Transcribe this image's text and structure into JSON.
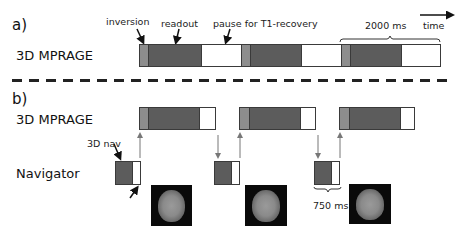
{
  "panel_a": {
    "section_label": "a)",
    "row_label": "3D MPRAGE",
    "annotations": {
      "inversion": "inversion",
      "readout": "readout",
      "pause": "pause for T1-recovery",
      "duration": "2000 ms",
      "time": "time"
    },
    "segments": [
      {
        "type": "inversion",
        "color": "#8d8d8d"
      },
      {
        "type": "readout",
        "color": "#5c5c5c"
      },
      {
        "type": "pause",
        "color": "#ffffff"
      }
    ],
    "repetitions": 3
  },
  "panel_b": {
    "section_label": "b)",
    "row_labels": {
      "mprage": "3D MPRAGE",
      "navigator": "Navigator"
    },
    "annotations": {
      "nav": "3D nav",
      "nav_duration": "750 ms"
    },
    "mprage_blocks": 3,
    "navigator_blocks": 3,
    "brain_images": 3
  }
}
